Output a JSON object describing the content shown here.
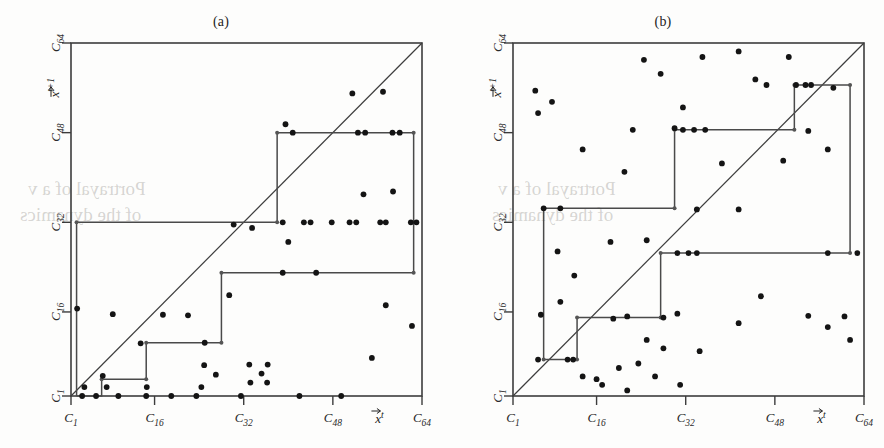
{
  "figure": {
    "background": "#fdfdfc",
    "ink": "#141414",
    "line_color": "#3c3c3c",
    "stair_color": "#4a4a4a"
  },
  "panels": [
    {
      "id": "a",
      "title": "(a)",
      "x_axis": {
        "title": "x",
        "title_sup": "t",
        "ticks": [
          {
            "label": "C",
            "sub": "1",
            "value": 1
          },
          {
            "label": "C",
            "sub": "16",
            "value": 16
          },
          {
            "label": "C",
            "sub": "32",
            "value": 32
          },
          {
            "label": "C",
            "sub": "48",
            "value": 48
          },
          {
            "label": "C",
            "sub": "64",
            "value": 64
          }
        ]
      },
      "y_axis": {
        "title": "x",
        "title_sup": "t+1",
        "ticks": [
          {
            "label": "C",
            "sub": "1",
            "value": 1
          },
          {
            "label": "C",
            "sub": "16",
            "value": 16
          },
          {
            "label": "C",
            "sub": "32",
            "value": 32
          },
          {
            "label": "C",
            "sub": "48",
            "value": 48
          },
          {
            "label": "C",
            "sub": "64",
            "value": 64
          }
        ]
      }
    },
    {
      "id": "b",
      "title": "(b)",
      "x_axis": {
        "title": "x",
        "title_sup": "t",
        "ticks": [
          {
            "label": "C",
            "sub": "1",
            "value": 1
          },
          {
            "label": "C",
            "sub": "16",
            "value": 16
          },
          {
            "label": "C",
            "sub": "32",
            "value": 32
          },
          {
            "label": "C",
            "sub": "48",
            "value": 48
          },
          {
            "label": "C",
            "sub": "64",
            "value": 64
          }
        ]
      },
      "y_axis": {
        "title": "x",
        "title_sup": "t+1",
        "ticks": [
          {
            "label": "C",
            "sub": "1",
            "value": 1
          },
          {
            "label": "C",
            "sub": "16",
            "value": 16
          },
          {
            "label": "C",
            "sub": "32",
            "value": 32
          },
          {
            "label": "C",
            "sub": "48",
            "value": 48
          },
          {
            "label": "C",
            "sub": "64",
            "value": 64
          }
        ]
      }
    }
  ],
  "chart_data": [
    {
      "type": "scatter",
      "panel": "a",
      "title": "(a)",
      "xlabel": "x^t",
      "ylabel": "x^t+1",
      "xlim": [
        1,
        64
      ],
      "ylim": [
        1,
        64
      ],
      "xticks": [
        1,
        16,
        32,
        48,
        64
      ],
      "yticks": [
        1,
        16,
        32,
        48,
        64
      ],
      "xticklabels": [
        "C_1",
        "C_16",
        "C_32",
        "C_48",
        "C_64"
      ],
      "yticklabels": [
        "C_1",
        "C_16",
        "C_32",
        "C_48",
        "C_64"
      ],
      "grid": false,
      "legend": false,
      "series": [
        {
          "name": "identity-line",
          "type": "line",
          "x": [
            1,
            64
          ],
          "y": [
            1,
            64
          ]
        },
        {
          "name": "staircase-path",
          "type": "step",
          "points": [
            [
              2.0,
              1.0
            ],
            [
              2.0,
              32.0
            ],
            [
              38.0,
              32.0
            ],
            [
              38.0,
              48.0
            ],
            [
              62.5,
              48.0
            ],
            [
              62.5,
              23.0
            ],
            [
              28.0,
              23.0
            ],
            [
              28.0,
              10.5
            ],
            [
              14.5,
              10.5
            ],
            [
              14.5,
              4.0
            ],
            [
              6.5,
              4.0
            ],
            [
              6.5,
              1.0
            ],
            [
              2.0,
              1.0
            ]
          ]
        },
        {
          "name": "staircase-corner-nodes",
          "type": "scatter",
          "points": [
            [
              2.0,
              32.0
            ],
            [
              38.0,
              32.0
            ],
            [
              38.0,
              48.0
            ],
            [
              62.5,
              48.0
            ],
            [
              62.5,
              23.0
            ],
            [
              28.0,
              23.0
            ],
            [
              28.0,
              10.5
            ],
            [
              14.5,
              10.5
            ],
            [
              14.5,
              4.0
            ],
            [
              6.5,
              4.0
            ]
          ]
        },
        {
          "name": "orbit-points",
          "type": "scatter",
          "points": [
            [
              3.0,
              1.0
            ],
            [
              5.5,
              1.0
            ],
            [
              9.5,
              1.0
            ],
            [
              14.5,
              1.0
            ],
            [
              19.0,
              1.0
            ],
            [
              23.5,
              1.0
            ],
            [
              31.5,
              1.0
            ],
            [
              42.0,
              1.0
            ],
            [
              49.5,
              1.0
            ],
            [
              3.4,
              2.6
            ],
            [
              7.4,
              2.6
            ],
            [
              14.6,
              2.6
            ],
            [
              24.4,
              2.6
            ],
            [
              33.2,
              3.4
            ],
            [
              36.2,
              3.4
            ],
            [
              6.7,
              4.6
            ],
            [
              27.0,
              4.8
            ],
            [
              35.2,
              5.0
            ],
            [
              24.9,
              6.5
            ],
            [
              33.0,
              6.6
            ],
            [
              36.3,
              6.6
            ],
            [
              55.0,
              7.8
            ],
            [
              13.5,
              10.4
            ],
            [
              25.0,
              10.5
            ],
            [
              17.5,
              15.5
            ],
            [
              22.0,
              15.4
            ],
            [
              2.1,
              16.6
            ],
            [
              8.5,
              15.6
            ],
            [
              62.2,
              13.5
            ],
            [
              29.4,
              19.0
            ],
            [
              57.5,
              17.2
            ],
            [
              39.0,
              23.0
            ],
            [
              45.0,
              23.0
            ],
            [
              40.0,
              28.5
            ],
            [
              39.0,
              32.0
            ],
            [
              42.8,
              32.0
            ],
            [
              44.0,
              32.0
            ],
            [
              47.8,
              32.0
            ],
            [
              51.0,
              32.0
            ],
            [
              52.2,
              32.0
            ],
            [
              56.5,
              32.0
            ],
            [
              57.5,
              32.0
            ],
            [
              62.0,
              32.0
            ],
            [
              63.0,
              32.0
            ],
            [
              33.5,
              31.0
            ],
            [
              30.2,
              31.6
            ],
            [
              53.5,
              37.0
            ],
            [
              58.8,
              37.5
            ],
            [
              40.8,
              48.0
            ],
            [
              52.5,
              48.0
            ],
            [
              53.8,
              48.0
            ],
            [
              58.7,
              48.0
            ],
            [
              60.0,
              48.0
            ],
            [
              39.5,
              49.5
            ],
            [
              51.5,
              55.0
            ],
            [
              57.0,
              55.3
            ]
          ]
        }
      ]
    },
    {
      "type": "scatter",
      "panel": "b",
      "title": "(b)",
      "xlabel": "x^t",
      "ylabel": "x^t+1",
      "xlim": [
        1,
        64
      ],
      "ylim": [
        1,
        64
      ],
      "xticks": [
        1,
        16,
        32,
        48,
        64
      ],
      "yticks": [
        1,
        16,
        32,
        48,
        64
      ],
      "xticklabels": [
        "C_1",
        "C_16",
        "C_32",
        "C_48",
        "C_64"
      ],
      "yticklabels": [
        "C_1",
        "C_16",
        "C_32",
        "C_48",
        "C_64"
      ],
      "grid": false,
      "legend": false,
      "series": [
        {
          "name": "identity-line",
          "type": "line",
          "x": [
            1,
            64
          ],
          "y": [
            1,
            64
          ]
        },
        {
          "name": "staircase-path",
          "type": "step",
          "points": [
            [
              6.5,
              7.5
            ],
            [
              6.5,
              34.5
            ],
            [
              30.0,
              34.5
            ],
            [
              30.0,
              48.5
            ],
            [
              51.5,
              48.5
            ],
            [
              51.5,
              56.5
            ],
            [
              61.5,
              56.5
            ],
            [
              61.5,
              26.5
            ],
            [
              27.5,
              26.5
            ],
            [
              27.5,
              15.0
            ],
            [
              12.5,
              15.0
            ],
            [
              12.5,
              7.5
            ],
            [
              6.5,
              7.5
            ]
          ]
        },
        {
          "name": "staircase-corner-nodes",
          "type": "scatter",
          "points": [
            [
              6.5,
              34.5
            ],
            [
              30.0,
              34.5
            ],
            [
              30.0,
              48.5
            ],
            [
              51.5,
              48.5
            ],
            [
              51.5,
              56.5
            ],
            [
              61.5,
              56.5
            ],
            [
              61.5,
              26.5
            ],
            [
              27.5,
              26.5
            ],
            [
              27.5,
              15.0
            ],
            [
              12.5,
              15.0
            ],
            [
              12.5,
              7.5
            ],
            [
              6.5,
              7.5
            ]
          ]
        },
        {
          "name": "orbit-points",
          "type": "scatter",
          "points": [
            [
              17.0,
              3.0
            ],
            [
              21.5,
              2.0
            ],
            [
              13.5,
              4.5
            ],
            [
              16.0,
              4.0
            ],
            [
              26.5,
              4.5
            ],
            [
              31.0,
              3.0
            ],
            [
              5.5,
              7.5
            ],
            [
              10.8,
              7.5
            ],
            [
              11.8,
              7.5
            ],
            [
              20.0,
              6.0
            ],
            [
              23.5,
              6.8
            ],
            [
              28.0,
              9.5
            ],
            [
              25.0,
              11.0
            ],
            [
              34.5,
              9.0
            ],
            [
              6.0,
              15.5
            ],
            [
              19.0,
              14.8
            ],
            [
              21.5,
              15.2
            ],
            [
              28.0,
              15.0
            ],
            [
              30.5,
              15.7
            ],
            [
              41.5,
              14.0
            ],
            [
              54.0,
              15.3
            ],
            [
              45.5,
              18.8
            ],
            [
              60.5,
              15.2
            ],
            [
              57.5,
              13.3
            ],
            [
              61.5,
              11.0
            ],
            [
              9.5,
              17.8
            ],
            [
              12.0,
              22.5
            ],
            [
              9.0,
              26.8
            ],
            [
              30.5,
              26.5
            ],
            [
              32.5,
              26.5
            ],
            [
              34.0,
              26.5
            ],
            [
              57.5,
              26.5
            ],
            [
              62.8,
              26.5
            ],
            [
              18.5,
              28.5
            ],
            [
              25.0,
              28.8
            ],
            [
              6.5,
              34.5
            ],
            [
              9.5,
              34.5
            ],
            [
              34.0,
              34.3
            ],
            [
              41.5,
              34.3
            ],
            [
              21.0,
              41.0
            ],
            [
              38.5,
              42.5
            ],
            [
              49.5,
              43.0
            ],
            [
              13.5,
              45.0
            ],
            [
              22.5,
              48.5
            ],
            [
              31.5,
              48.5
            ],
            [
              33.5,
              48.5
            ],
            [
              35.5,
              48.5
            ],
            [
              30.0,
              48.8
            ],
            [
              54.0,
              48.3
            ],
            [
              5.5,
              51.5
            ],
            [
              8.0,
              53.5
            ],
            [
              57.5,
              45.0
            ],
            [
              31.5,
              52.5
            ],
            [
              51.8,
              56.5
            ],
            [
              53.5,
              56.5
            ],
            [
              54.5,
              56.5
            ],
            [
              58.5,
              56.0
            ],
            [
              5.0,
              55.5
            ],
            [
              44.5,
              57.5
            ],
            [
              46.5,
              56.5
            ],
            [
              27.5,
              58.5
            ],
            [
              35.0,
              61.5
            ],
            [
              41.5,
              62.5
            ],
            [
              24.5,
              61.0
            ],
            [
              50.5,
              61.5
            ]
          ]
        }
      ]
    }
  ],
  "bleed_text": [
    {
      "text": "Portrayal of a v",
      "x": 28,
      "y": 188
    },
    {
      "text": "of the dynamics",
      "x": 20,
      "y": 214
    },
    {
      "text": "Portrayal of a v",
      "x": 498,
      "y": 188
    },
    {
      "text": "of the dynamics",
      "x": 492,
      "y": 214
    }
  ]
}
